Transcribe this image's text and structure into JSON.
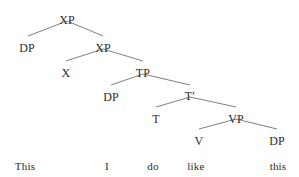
{
  "diagram": {
    "kind": "syntax-tree",
    "sentence": "This I do like this",
    "text_color": "#2b2b2b",
    "line_color": "#6f6f6f",
    "background_color": "#ffffff",
    "nodes": [
      {
        "id": "xp-root",
        "label": "XP",
        "x": 67,
        "y": 14
      },
      {
        "id": "dp-spec",
        "label": "DP",
        "x": 27,
        "y": 42
      },
      {
        "id": "xp-bar",
        "label": "XP",
        "x": 103,
        "y": 42
      },
      {
        "id": "x-head",
        "label": "X",
        "x": 66,
        "y": 67
      },
      {
        "id": "tp",
        "label": "TP",
        "x": 143,
        "y": 67
      },
      {
        "id": "dp-subj",
        "label": "DP",
        "x": 111,
        "y": 91
      },
      {
        "id": "t-bar",
        "label": "Tʹ",
        "x": 190,
        "y": 90
      },
      {
        "id": "t-head",
        "label": "T",
        "x": 156,
        "y": 113
      },
      {
        "id": "vp",
        "label": "VP",
        "x": 236,
        "y": 113
      },
      {
        "id": "v-head",
        "label": "V",
        "x": 199,
        "y": 135
      },
      {
        "id": "dp-obj",
        "label": "DP",
        "x": 277,
        "y": 135
      }
    ],
    "branches": [
      {
        "id": "xp-root-to-dp-spec",
        "x1": 67,
        "y1": 21,
        "x2": 28,
        "y2": 36
      },
      {
        "id": "xp-root-to-xp-bar",
        "x1": 67,
        "y1": 21,
        "x2": 103,
        "y2": 36
      },
      {
        "id": "xp-bar-to-x-head",
        "x1": 103,
        "y1": 49,
        "x2": 66,
        "y2": 61
      },
      {
        "id": "xp-bar-to-tp",
        "x1": 103,
        "y1": 49,
        "x2": 143,
        "y2": 61
      },
      {
        "id": "tp-to-dp-subj",
        "x1": 143,
        "y1": 74,
        "x2": 111,
        "y2": 85
      },
      {
        "id": "tp-to-t-bar",
        "x1": 143,
        "y1": 74,
        "x2": 190,
        "y2": 85
      },
      {
        "id": "t-bar-to-t-head",
        "x1": 190,
        "y1": 97,
        "x2": 156,
        "y2": 107
      },
      {
        "id": "t-bar-to-vp",
        "x1": 190,
        "y1": 97,
        "x2": 236,
        "y2": 107
      },
      {
        "id": "vp-to-v-head",
        "x1": 236,
        "y1": 119,
        "x2": 199,
        "y2": 129
      },
      {
        "id": "vp-to-dp-obj",
        "x1": 236,
        "y1": 119,
        "x2": 277,
        "y2": 129
      }
    ],
    "words": [
      {
        "id": "word-this-1",
        "label": "This",
        "x": 25,
        "y": 161
      },
      {
        "id": "word-i",
        "label": "I",
        "x": 107,
        "y": 161
      },
      {
        "id": "word-do",
        "label": "do",
        "x": 153,
        "y": 161
      },
      {
        "id": "word-like",
        "label": "like",
        "x": 196,
        "y": 161
      },
      {
        "id": "word-this-2",
        "label": "this",
        "x": 278,
        "y": 161
      }
    ]
  }
}
